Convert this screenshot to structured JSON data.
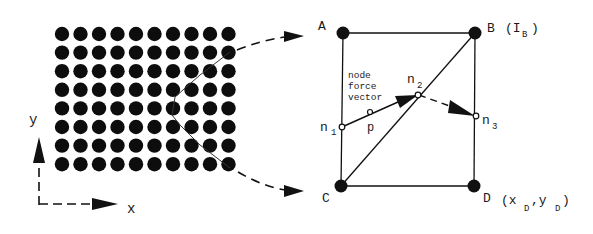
{
  "grid": {
    "columns": 10,
    "rows": 8,
    "description": "lattice of nodes"
  },
  "axes": {
    "x_label": "x",
    "y_label": "y"
  },
  "element": {
    "corners": {
      "A": {
        "label": "A"
      },
      "B": {
        "label": "B",
        "annotation": "(I",
        "annotation_sub": "B",
        "annotation_close": ")"
      },
      "C": {
        "label": "C"
      },
      "D": {
        "label": "D",
        "annotation_open": "(x",
        "x_sub": "D",
        "comma": ",y",
        "y_sub": "D",
        "annotation_close": ")"
      }
    },
    "nodes": {
      "n1": {
        "label": "n",
        "sub": "1"
      },
      "n2": {
        "label": "n",
        "sub": "2"
      },
      "n3": {
        "label": "n",
        "sub": "3"
      },
      "p": {
        "label": "p"
      }
    },
    "caption_lines": [
      "node",
      "force",
      "vector"
    ]
  },
  "colors": {
    "ink": "#111111",
    "background": "#ffffff"
  }
}
